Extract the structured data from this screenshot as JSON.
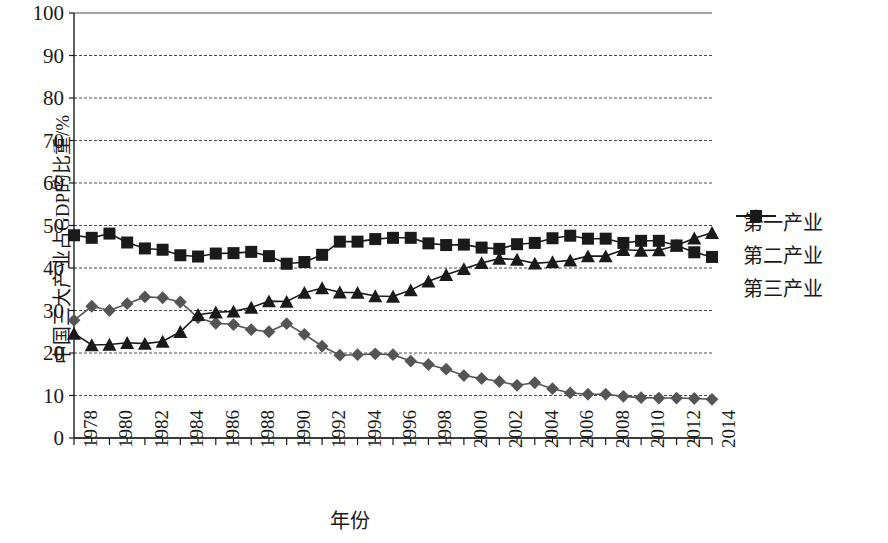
{
  "chart_data": {
    "type": "line",
    "title": "",
    "xlabel": "年份",
    "ylabel": "中国三大产业占GDP的比重/%",
    "ylim": [
      0,
      100
    ],
    "ytick_step": 10,
    "yticks": [
      "0",
      "10",
      "20",
      "30",
      "40",
      "50",
      "60",
      "70",
      "80",
      "90",
      "100"
    ],
    "grid": true,
    "legend_position": "right",
    "x": [
      1978,
      1979,
      1980,
      1981,
      1982,
      1983,
      1984,
      1985,
      1986,
      1987,
      1988,
      1989,
      1990,
      1991,
      1992,
      1993,
      1994,
      1995,
      1996,
      1997,
      1998,
      1999,
      2000,
      2001,
      2002,
      2003,
      2004,
      2005,
      2006,
      2007,
      2008,
      2009,
      2010,
      2011,
      2012,
      2013,
      2014
    ],
    "xtick_labels": [
      "1978",
      "1980",
      "1982",
      "1984",
      "1986",
      "1988",
      "1990",
      "1992",
      "1994",
      "1996",
      "1998",
      "2000",
      "2002",
      "2004",
      "2006",
      "2008",
      "2010",
      "2012",
      "2014"
    ],
    "series": [
      {
        "name": "第一产业",
        "marker": "diamond",
        "color": "#555555",
        "values": [
          27.7,
          31.0,
          30.0,
          31.6,
          33.2,
          33.0,
          32.0,
          28.3,
          27.0,
          26.7,
          25.5,
          25.0,
          26.9,
          24.4,
          21.6,
          19.5,
          19.6,
          19.8,
          19.6,
          18.1,
          17.3,
          16.2,
          14.7,
          14.0,
          13.3,
          12.4,
          13.0,
          11.6,
          10.6,
          10.3,
          10.3,
          9.8,
          9.5,
          9.4,
          9.4,
          9.3,
          9.1
        ]
      },
      {
        "name": "第二产业",
        "marker": "square",
        "color": "#1a1a1a",
        "values": [
          47.7,
          47.1,
          48.1,
          46.0,
          44.6,
          44.3,
          43.0,
          42.7,
          43.4,
          43.5,
          43.8,
          42.8,
          41.0,
          41.4,
          43.1,
          46.2,
          46.2,
          46.8,
          47.1,
          47.1,
          45.8,
          45.4,
          45.5,
          44.8,
          44.5,
          45.6,
          45.9,
          47.0,
          47.6,
          46.9,
          46.9,
          45.9,
          46.4,
          46.4,
          45.3,
          43.7,
          42.6
        ]
      },
      {
        "name": "第三产业",
        "marker": "triangle",
        "color": "#1a1a1a",
        "values": [
          24.6,
          21.9,
          22.0,
          22.4,
          22.2,
          22.7,
          25.0,
          29.0,
          29.6,
          29.8,
          30.7,
          32.2,
          32.1,
          34.2,
          35.3,
          34.3,
          34.2,
          33.4,
          33.3,
          34.8,
          36.9,
          38.4,
          39.8,
          41.2,
          42.2,
          42.0,
          41.1,
          41.4,
          41.8,
          42.8,
          42.8,
          44.3,
          44.1,
          44.2,
          45.3,
          47.0,
          48.3
        ]
      }
    ]
  },
  "legend": {
    "items": [
      {
        "label": "第一产业"
      },
      {
        "label": "第二产业"
      },
      {
        "label": "第三产业"
      }
    ]
  }
}
